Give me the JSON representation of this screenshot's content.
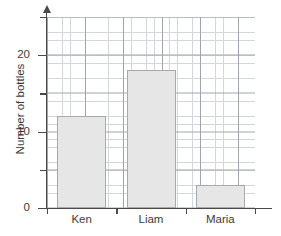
{
  "chart_data": {
    "type": "bar",
    "title": "",
    "xlabel": "",
    "ylabel": "Number of bottles",
    "categories": [
      "Ken",
      "Liam",
      "Maria"
    ],
    "values": [
      12,
      18,
      3
    ],
    "ylim": [
      0,
      25
    ],
    "y_tick_labels": [
      "0",
      "10",
      "20"
    ],
    "y_ticks_major": [
      0,
      10,
      20
    ],
    "y_ticks_minor": [
      5,
      15,
      25
    ],
    "grid": true,
    "grid_minor_step": 1,
    "grid_major_step": 5,
    "legend": "none",
    "bar_fill_color": "#e6e6e6",
    "bar_border_color": "#a9a9a9",
    "axis_color": "#4a4a4a",
    "grid_minor_color": "#d3d6dd",
    "grid_major_color": "#9fa4af"
  },
  "axis": {
    "y_title": "Number of bottles",
    "tick_0": "0",
    "tick_10": "10",
    "tick_20": "20"
  },
  "bars": [
    {
      "label": "Ken",
      "value": 12
    },
    {
      "label": "Liam",
      "value": 18
    },
    {
      "label": "Maria",
      "value": 3
    }
  ]
}
